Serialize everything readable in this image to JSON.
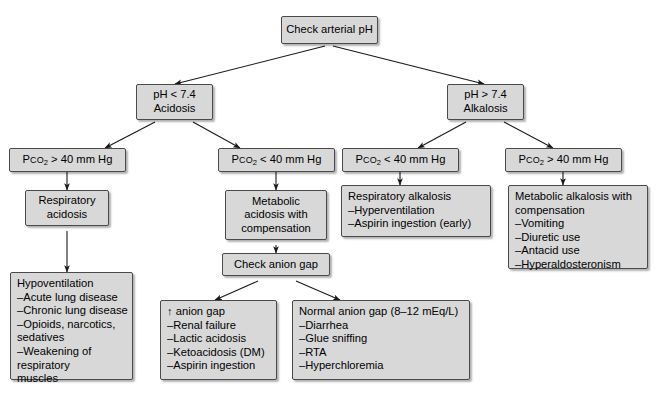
{
  "diagram": {
    "box_fill": "#d8d8d8",
    "box_border": "#4a4a4a",
    "arrow_color": "#1a1a1a",
    "background": "#ffffff"
  },
  "nodes": {
    "root": {
      "label": "Check arterial pH"
    },
    "acidosis": {
      "line1": "pH < 7.4",
      "line2": "Acidosis"
    },
    "alkalosis": {
      "line1": "pH > 7.4",
      "line2": "Alkalosis"
    },
    "pco2_high_left": {
      "prefix": "P",
      "smallcaps": "CO",
      "sub": "2",
      "rest": " > 40 mm Hg"
    },
    "pco2_low_left": {
      "prefix": "P",
      "smallcaps": "CO",
      "sub": "2",
      "rest": " < 40 mm Hg"
    },
    "pco2_low_right": {
      "prefix": "P",
      "smallcaps": "CO",
      "sub": "2",
      "rest": " < 40 mm Hg"
    },
    "pco2_high_right": {
      "prefix": "P",
      "smallcaps": "CO",
      "sub": "2",
      "rest": " > 40 mm Hg"
    },
    "respiratory_acidosis": {
      "line1": "Respiratory",
      "line2": "acidosis"
    },
    "metabolic_acidosis": {
      "line1": "Metabolic",
      "line2": "acidosis with",
      "line3": "compensation"
    },
    "check_anion_gap": {
      "label": "Check anion gap"
    },
    "hypoventilation": {
      "heading": "Hypoventilation",
      "items": [
        "–Acute lung disease",
        "–Chronic lung disease",
        "–Opioids, narcotics,",
        "  sedatives",
        "–Weakening of",
        "  respiratory",
        "  muscles"
      ]
    },
    "high_anion_gap": {
      "heading": "↑ anion gap",
      "items": [
        "–Renal failure",
        "–Lactic acidosis",
        "–Ketoacidosis (DM)",
        "–Aspirin ingestion"
      ]
    },
    "normal_anion_gap": {
      "heading": "Normal anion gap (8–12 mEq/L)",
      "items": [
        "–Diarrhea",
        "–Glue sniffing",
        "–RTA",
        "–Hyperchloremia"
      ]
    },
    "respiratory_alkalosis": {
      "heading": "Respiratory alkalosis",
      "items": [
        "–Hyperventilation",
        "–Aspirin ingestion (early)"
      ]
    },
    "metabolic_alkalosis": {
      "heading1": "Metabolic alkalosis with",
      "heading2": "compensation",
      "items": [
        "–Vomiting",
        "–Diuretic use",
        "–Antacid use",
        "–Hyperaldosteronism"
      ]
    }
  }
}
